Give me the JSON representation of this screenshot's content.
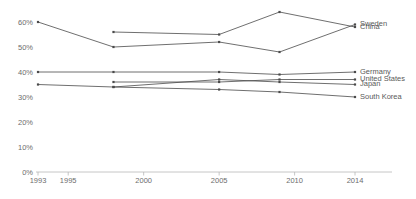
{
  "chart_data": {
    "type": "line",
    "title": "",
    "subtitle": "",
    "xlabel": "",
    "ylabel": "",
    "xtick_labels": [
      "1993",
      "1995",
      "2000",
      "2005",
      "2010",
      "2014"
    ],
    "xtick_values": [
      1993,
      1995,
      2000,
      2005,
      2010,
      2014
    ],
    "ytick_labels": [
      "0%",
      "10%",
      "20%",
      "30%",
      "40%",
      "50%",
      "60%"
    ],
    "ytick_values": [
      0,
      10,
      20,
      30,
      40,
      50,
      60
    ],
    "xlim": [
      1993,
      2014
    ],
    "ylim": [
      0,
      60
    ],
    "grid": false,
    "legend_position": "right-inline-labels",
    "line_color": "#4a4a4a",
    "axis_color": "#b8b8b8",
    "label_color": "#6d6d6d",
    "series": [
      {
        "name": "Sweden",
        "x": [
          1993,
          1998,
          2005,
          2009,
          2014
        ],
        "values": [
          60,
          50,
          52,
          48,
          59
        ]
      },
      {
        "name": "China",
        "x": [
          1998,
          2005,
          2009,
          2014
        ],
        "values": [
          56,
          55,
          64,
          58
        ]
      },
      {
        "name": "Germany",
        "x": [
          1993,
          1998,
          2005,
          2009,
          2014
        ],
        "values": [
          40,
          40,
          40,
          39,
          40
        ]
      },
      {
        "name": "United States",
        "x": [
          1998,
          2005,
          2009,
          2014
        ],
        "values": [
          36,
          36,
          37,
          37
        ]
      },
      {
        "name": "Japan",
        "x": [
          1998,
          2005,
          2009,
          2014
        ],
        "values": [
          34,
          37,
          36,
          35
        ]
      },
      {
        "name": "South Korea",
        "x": [
          1993,
          1998,
          2005,
          2009,
          2014
        ],
        "values": [
          35,
          34,
          33,
          32,
          30
        ]
      }
    ]
  }
}
